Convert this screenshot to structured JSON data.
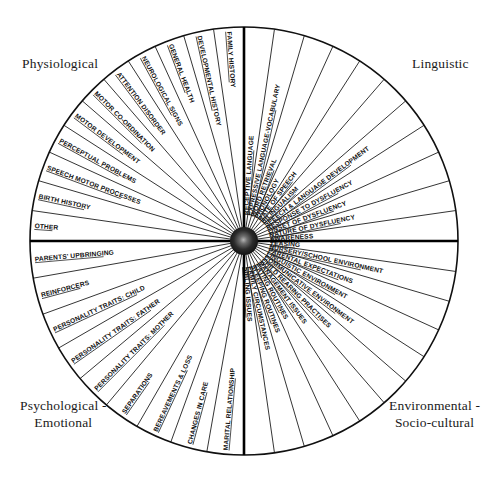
{
  "center": {
    "cx": 244,
    "cy": 241,
    "r": 214,
    "hub_r": 14
  },
  "quadrants": [
    {
      "id": "physiological",
      "label": "Physiological",
      "start_angle": 180,
      "end_angle": 270,
      "sectors": [
        "OTHER",
        "BIRTH HISTORY",
        "SPEECH MOTOR PROCESSES",
        "PERCEPTUAL PROBLEMS",
        "MOTOR DEVELOPMENT",
        "MOTOR CO-ORDINATION",
        "ATTENTION DISORDER",
        "NEUROLOGICAL SIGNS",
        "GENERAL HEALTH",
        "DEVELOPMENTAL HISTORY",
        "FAMILY HISTORY"
      ]
    },
    {
      "id": "linguistic",
      "label": "Linguistic",
      "start_angle": 270,
      "end_angle": 360,
      "sectors": [
        "RECEPTIVE LANGUAGE",
        "EXPRESSIVE LANGUAGE-VOCABULARY",
        "WORD RETRIEVAL",
        "PHONOLOGY",
        "RATE OF SPEECH",
        "BILINGUALISM",
        "SPEECH & LANGUAGE DEVELOPMENT",
        "RESPONSE TO DYSFLUENCY",
        "ONSET OF DYSFLUENCY",
        "NATURE OF DYSFLUENCY",
        "AWARENESS"
      ]
    },
    {
      "id": "environmental",
      "label": "Environmental -\nSocio-cultural",
      "start_angle": 0,
      "end_angle": 90,
      "sectors": [
        "TEASING",
        "NURSERY/SCHOOL ENVIRONMENT",
        "PARENTAL EXPECTATIONS",
        "LINGUISTIC ENVIRONMENT",
        "COMMUNICATIVE ENVIRONMENT",
        "CHILD REARING PRACTISES",
        "MANAGEMENT ISSUES",
        "EATING ROUTINES",
        "SLEEPING ROUTINES",
        "FAMILY CIRCUMSTANCES",
        "SIBLING ISSUES"
      ]
    },
    {
      "id": "psychological",
      "label": "Psychological -\nEmotional",
      "start_angle": 90,
      "end_angle": 180,
      "sectors": [
        "MARITAL RELATIONSHIP",
        "CHANGES IN CARE",
        "BEREAVEMENTS & LOSS",
        "SEPARATIONS",
        "PERSONALITY TRAITS: MOTHER",
        "PERSONALITY TRAITS: FATHER",
        "PERSONALITY TRAITS: CHILD",
        "REINFORCERS",
        "PARENTS' UPBRINGING"
      ]
    }
  ],
  "colors": {
    "ink": "#101010",
    "paper": "#ffffff",
    "hub": "#141414",
    "hub_highlight": "#8f8f8f"
  }
}
